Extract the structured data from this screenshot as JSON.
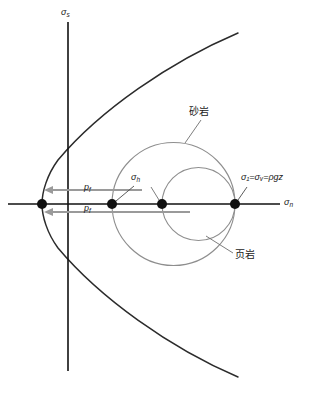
{
  "figure": {
    "type": "mohr-circle-diagram",
    "background_color": "#ffffff",
    "axes": {
      "y_label": "σ",
      "y_label_sub": "s",
      "x_label": "σ",
      "x_label_sub": "n",
      "axis_color": "#111111",
      "origin_px": {
        "x": 68,
        "y": 204
      }
    },
    "labels": {
      "sigma_h": {
        "text": "σ",
        "sub": "h"
      },
      "sigma_v_relation": {
        "text": "σ₁=σᵥ=ρgz"
      },
      "pore_pressure_upper": {
        "text": "p",
        "sub": "f"
      },
      "pore_pressure_lower": {
        "text": "p",
        "sub": "f"
      },
      "sandstone": {
        "text": "砂岩"
      },
      "shale": {
        "text": "页岩"
      }
    },
    "points": [
      {
        "name": "failure-envelope-vertex",
        "x": 42,
        "y": 204
      },
      {
        "name": "sigma-h-point",
        "x": 112,
        "y": 204
      },
      {
        "name": "shale-left-point",
        "x": 162,
        "y": 204
      },
      {
        "name": "sigma-v-point",
        "x": 235,
        "y": 204
      }
    ],
    "circles": [
      {
        "name": "sandstone-circle",
        "center_x": 173.5,
        "center_y": 204,
        "radius": 61.5,
        "color": "#8e8e8e"
      },
      {
        "name": "shale-circle",
        "center_x": 198.5,
        "center_y": 204,
        "radius": 36.5,
        "color": "#8e8e8e"
      }
    ],
    "envelope": {
      "name": "failure-envelope",
      "shape": "parabola-opening-right",
      "vertex_x": 42,
      "vertex_y": 204,
      "end_x": 238,
      "top_y": 33,
      "bottom_y": 377,
      "color": "#2b2b2b"
    },
    "arrows": [
      {
        "name": "pf-arrow-upper",
        "from_x": 142,
        "to_x": 44,
        "y": 190,
        "color": "#9a9a9a"
      },
      {
        "name": "pf-arrow-lower",
        "from_x": 190,
        "to_x": 44,
        "y": 212,
        "color": "#9a9a9a"
      }
    ],
    "leader_lines": [
      {
        "name": "sandstone-leader",
        "from_x": 200,
        "from_y": 121,
        "to_x": 185,
        "to_y": 143
      },
      {
        "name": "shale-leader",
        "from_x": 232,
        "from_y": 254,
        "to_x": 207,
        "to_y": 237
      },
      {
        "name": "sigma-h-leader",
        "from_x": 135,
        "from_y": 186,
        "to_x": 116,
        "to_y": 201
      },
      {
        "name": "sigma1-leader",
        "from_x": 246,
        "from_y": 186,
        "to_x": 238,
        "to_y": 201
      },
      {
        "name": "shale-center-leader",
        "from_x": 152,
        "from_y": 186,
        "to_x": 160,
        "to_y": 201
      }
    ]
  }
}
